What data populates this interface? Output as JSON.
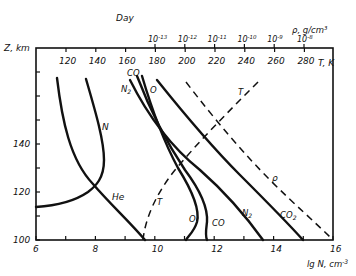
{
  "chart_data": {
    "type": "line",
    "title": "",
    "top_axis_title": "Day",
    "xlabel": "lg N, cm^-3",
    "ylabel": "Z, km",
    "secondary_xlabel_T": "T, K",
    "secondary_xlabel_rho": "ρ, g/cm³",
    "xlim": [
      6,
      16
    ],
    "ylim": [
      100,
      180
    ],
    "x_ticks": [
      "6",
      "8",
      "10",
      "12",
      "14",
      "16"
    ],
    "y_ticks": [
      "100",
      "120",
      "140"
    ],
    "T_ticks": [
      "120",
      "140",
      "160",
      "180",
      "200",
      "220",
      "240",
      "260",
      "280"
    ],
    "rho_ticks": [
      "10-13",
      "10-12",
      "10-11",
      "10-10",
      "10-9",
      "10-8"
    ],
    "grid": false,
    "series": [
      {
        "name": "He",
        "style": "solid",
        "z": [
          167,
          150,
          130,
          118,
          110,
          100
        ],
        "lgN": [
          6.7,
          7.0,
          7.5,
          8.0,
          8.9,
          9.8
        ]
      },
      {
        "name": "N",
        "style": "solid",
        "z": [
          167,
          150,
          135,
          125,
          118,
          113,
          110
        ],
        "lgN": [
          7.7,
          8.1,
          8.3,
          8.3,
          8.0,
          7.0,
          6.0
        ]
      },
      {
        "name": "N2",
        "style": "solid",
        "z": [
          167,
          150,
          130,
          115,
          100
        ],
        "lgN": [
          9.5,
          10.0,
          11.0,
          12.2,
          13.7
        ]
      },
      {
        "name": "CO",
        "style": "solid",
        "z": [
          169,
          150,
          130,
          115,
          108,
          100
        ],
        "lgN": [
          9.7,
          10.2,
          10.9,
          11.7,
          11.8,
          11.7
        ]
      },
      {
        "name": "O",
        "style": "solid",
        "z": [
          169,
          150,
          130,
          115,
          108,
          100
        ],
        "lgN": [
          9.9,
          10.4,
          10.9,
          11.4,
          11.4,
          11.0
        ]
      },
      {
        "name": "CO2",
        "style": "solid",
        "z": [
          167,
          150,
          130,
          115,
          100
        ],
        "lgN": [
          10.6,
          11.3,
          12.6,
          13.6,
          15.0
        ]
      },
      {
        "name": "ρ",
        "style": "dashed",
        "z": [
          166,
          150,
          130,
          115,
          100
        ],
        "lgN": [
          11.6,
          12.3,
          13.6,
          14.6,
          16.0
        ]
      },
      {
        "name": "T",
        "style": "dashed",
        "z": [
          100,
          110,
          125,
          140,
          155,
          167
        ],
        "T_K": [
          170,
          172,
          182,
          205,
          230,
          245
        ]
      }
    ],
    "annotations": [
      "He",
      "N",
      "N2",
      "CO",
      "O",
      "CO2",
      "ρ",
      "T",
      "T"
    ]
  },
  "labels": {
    "day": "Day",
    "z_axis": "Z, km",
    "t_axis": "T, K",
    "rho_axis": "ρ, g/cm³",
    "n_axis": "lg N, cm",
    "n_axis_exp": "-3"
  }
}
